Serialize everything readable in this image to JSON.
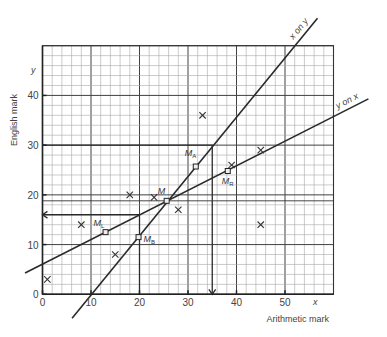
{
  "chart_data": {
    "type": "scatter",
    "title": "",
    "xlabel": "Arithmetic mark",
    "ylabel": "English mark",
    "x_axis_var": "x",
    "y_axis_var": "y",
    "xlim": [
      0,
      60
    ],
    "ylim": [
      0,
      50
    ],
    "grid": true,
    "x_ticks": [
      0,
      10,
      20,
      30,
      40,
      50
    ],
    "y_ticks": [
      0,
      10,
      20,
      30,
      40
    ],
    "x_tick_labels": [
      "0",
      "10",
      "20",
      "30",
      "40",
      "50"
    ],
    "y_tick_labels": [
      "0",
      "10",
      "20",
      "30",
      "40"
    ],
    "points": [
      {
        "x": 1,
        "y": 3
      },
      {
        "x": 8,
        "y": 14
      },
      {
        "x": 15,
        "y": 8
      },
      {
        "x": 18,
        "y": 20
      },
      {
        "x": 23,
        "y": 19.5
      },
      {
        "x": 28,
        "y": 17
      },
      {
        "x": 33,
        "y": 36
      },
      {
        "x": 39,
        "y": 26
      },
      {
        "x": 45,
        "y": 29
      },
      {
        "x": 45,
        "y": 14
      }
    ],
    "means": [
      {
        "id": "M",
        "label": "M",
        "sub": "",
        "x": 25.6,
        "y": 18.8
      },
      {
        "id": "ML",
        "label": "M",
        "sub": "L",
        "x": 13,
        "y": 12.5
      },
      {
        "id": "MR",
        "label": "M",
        "sub": "R",
        "x": 38.2,
        "y": 24.8
      },
      {
        "id": "MA",
        "label": "M",
        "sub": "A",
        "x": 31.6,
        "y": 25.7
      },
      {
        "id": "MB",
        "label": "M",
        "sub": "B",
        "x": 19.8,
        "y": 11.5
      }
    ],
    "regression_lines": [
      {
        "name": "y on x",
        "label": "y on x",
        "from": [
          -3.6,
          4.3
        ],
        "to": [
          67.2,
          39.3
        ]
      },
      {
        "name": "x on y",
        "label": "x on y",
        "from": [
          6.1,
          -4.8
        ],
        "to": [
          56.7,
          55.5
        ]
      }
    ],
    "mean_lines": [
      {
        "orientation": "horizontal",
        "y": 18.8
      }
    ],
    "reading_lines": [
      {
        "name": "estimate-x-from-y30",
        "path": [
          [
            0,
            30
          ],
          [
            35,
            30
          ],
          [
            35,
            0
          ]
        ],
        "arrow_at_end": true
      },
      {
        "name": "estimate-y-from-x20",
        "path": [
          [
            20,
            0
          ],
          [
            20,
            16
          ],
          [
            0,
            16
          ]
        ],
        "arrow_at_end": true
      }
    ]
  }
}
